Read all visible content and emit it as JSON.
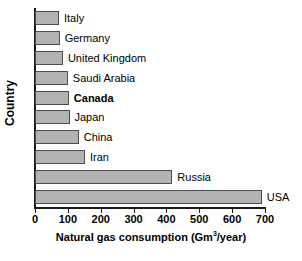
{
  "chart_data": {
    "type": "bar",
    "orientation": "horizontal",
    "title": "",
    "xlabel": "Natural gas consumption (Gm3/year)",
    "xlabel_prefix": "Natural gas consumption (Gm",
    "xlabel_sup": "3",
    "xlabel_suffix": "/year)",
    "ylabel": "Country",
    "categories": [
      "Italy",
      "Germany",
      "United Kingdom",
      "Saudi Arabia",
      "Canada",
      "Japan",
      "China",
      "Iran",
      "Russia",
      "USA"
    ],
    "values": [
      73,
      75,
      85,
      100,
      103,
      105,
      133,
      152,
      418,
      690
    ],
    "highlighted_category": "Canada",
    "xlim": [
      0,
      700
    ],
    "xticks": [
      0,
      100,
      200,
      300,
      400,
      500,
      600,
      700
    ],
    "xtick_labels": [
      "0",
      "100",
      "200",
      "300",
      "400",
      "500",
      "600",
      "700"
    ],
    "grid": false,
    "legend": false,
    "bar_fill_color": "#b3b3b3",
    "bar_border_color": "#4d4d4d",
    "axis_color": "#1a1a1a",
    "background_color": "#ffffff"
  }
}
